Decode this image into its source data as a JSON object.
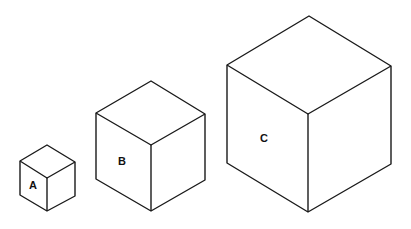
{
  "diagram": {
    "type": "isometric cubes comparison",
    "cubes": [
      {
        "label": "A",
        "label_pos": [
          33,
          185
        ],
        "vertices": {
          "top": [
            47,
            145
          ],
          "left_top": [
            20,
            161
          ],
          "right_top": [
            75,
            162
          ],
          "center": [
            47,
            178
          ],
          "bottom": [
            47,
            211
          ],
          "left_bottom": [
            20,
            195
          ],
          "right_bottom": [
            75,
            196
          ]
        }
      },
      {
        "label": "B",
        "label_pos": [
          122,
          161
        ],
        "vertices": {
          "top": [
            151,
            81
          ],
          "left_top": [
            96,
            113
          ],
          "right_top": [
            205,
            114
          ],
          "center": [
            151,
            145
          ],
          "bottom": [
            151,
            211
          ],
          "left_bottom": [
            96,
            179
          ],
          "right_bottom": [
            205,
            180
          ]
        }
      },
      {
        "label": "C",
        "label_pos": [
          264,
          138
        ],
        "vertices": {
          "top": [
            309,
            16
          ],
          "left_top": [
            227,
            65
          ],
          "right_top": [
            391,
            66
          ],
          "center": [
            308,
            114
          ],
          "bottom": [
            308,
            212
          ],
          "left_bottom": [
            227,
            163
          ],
          "right_bottom": [
            391,
            164
          ]
        }
      }
    ],
    "colors": {
      "stroke": "#1a1a1a",
      "background": "#ffffff"
    }
  }
}
